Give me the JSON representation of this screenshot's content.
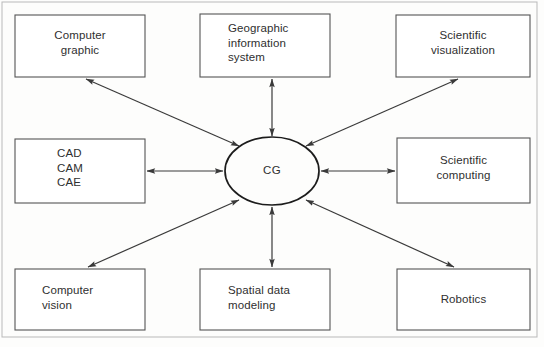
{
  "figure": {
    "type": "relationship-diagram",
    "outer_border": {
      "x": 2,
      "y": 2,
      "width": 535,
      "height": 335,
      "stroke": "#b9b9b9",
      "stroke_width": 1
    },
    "colors": {
      "background": "#fdfdfc",
      "box_stroke": "#555555",
      "ellipse_stroke": "#1c1c1c",
      "arrow": "#3a3a3a",
      "text": "#2f2f2f",
      "outer_border": "#b9b9b9"
    },
    "center": {
      "label": "CG",
      "shape": "ellipse",
      "cx": 272,
      "cy": 171,
      "rx": 47,
      "ry": 34
    },
    "nodes": [
      {
        "id": "computer-graphic",
        "label": "Computer\ngraphic",
        "x": 15,
        "y": 15,
        "width": 130,
        "height": 62,
        "align": "center",
        "text_x": 50,
        "text_y": 28
      },
      {
        "id": "geographic-information-system",
        "label": "Geographic\ninformation\nsystem",
        "x": 200,
        "y": 14,
        "width": 130,
        "height": 63,
        "align": "left",
        "text_x": 228,
        "text_y": 21
      },
      {
        "id": "scientific-visualization",
        "label": "Scientific\nvisualization",
        "x": 396,
        "y": 15,
        "width": 134,
        "height": 62,
        "align": "center",
        "text_x": 424,
        "text_y": 28
      },
      {
        "id": "cad-cam-cae",
        "label": "CAD\nCAM\nCAE",
        "x": 15,
        "y": 139,
        "width": 130,
        "height": 64,
        "align": "left",
        "text_x": 57,
        "text_y": 146
      },
      {
        "id": "scientific-computing",
        "label": "Scientific\ncomputing",
        "x": 397,
        "y": 138,
        "width": 133,
        "height": 65,
        "align": "center",
        "text_x": 424,
        "text_y": 153
      },
      {
        "id": "computer-vision",
        "label": "Computer\nvision",
        "x": 15,
        "y": 269,
        "width": 130,
        "height": 61,
        "align": "left",
        "text_x": 42,
        "text_y": 283
      },
      {
        "id": "spatial-data-modeling",
        "label": "Spatial data\nmodeling",
        "x": 200,
        "y": 269,
        "width": 130,
        "height": 61,
        "align": "left",
        "text_x": 228,
        "text_y": 283
      },
      {
        "id": "robotics",
        "label": "Robotics",
        "x": 397,
        "y": 269,
        "width": 133,
        "height": 61,
        "align": "center",
        "text_x": 424,
        "text_y": 292
      }
    ],
    "connectors": [
      {
        "id": "connector-computer-graphic",
        "from": "computer-graphic",
        "to": "center",
        "double_headed": true,
        "x1": 86,
        "y1": 79,
        "x2": 239,
        "y2": 146
      },
      {
        "id": "connector-geographic-information-system",
        "from": "geographic-information-system",
        "to": "center",
        "double_headed": true,
        "x1": 272,
        "y1": 79,
        "x2": 272,
        "y2": 136
      },
      {
        "id": "connector-scientific-visualization",
        "from": "scientific-visualization",
        "to": "center",
        "double_headed": true,
        "x1": 458,
        "y1": 79,
        "x2": 306,
        "y2": 146
      },
      {
        "id": "connector-cad-cam-cae",
        "from": "cad-cam-cae",
        "to": "center",
        "double_headed": true,
        "x1": 147,
        "y1": 171,
        "x2": 223,
        "y2": 171
      },
      {
        "id": "connector-scientific-computing",
        "from": "scientific-computing",
        "to": "center",
        "double_headed": true,
        "x1": 395,
        "y1": 171,
        "x2": 321,
        "y2": 171
      },
      {
        "id": "connector-computer-vision",
        "from": "computer-vision",
        "to": "center",
        "double_headed": true,
        "x1": 88,
        "y1": 267,
        "x2": 239,
        "y2": 200
      },
      {
        "id": "connector-spatial-data-modeling",
        "from": "spatial-data-modeling",
        "to": "center",
        "double_headed": true,
        "x1": 272,
        "y1": 267,
        "x2": 272,
        "y2": 207
      },
      {
        "id": "connector-robotics",
        "from": "robotics",
        "to": "center",
        "double_headed": true,
        "x1": 454,
        "y1": 267,
        "x2": 306,
        "y2": 200
      }
    ]
  }
}
